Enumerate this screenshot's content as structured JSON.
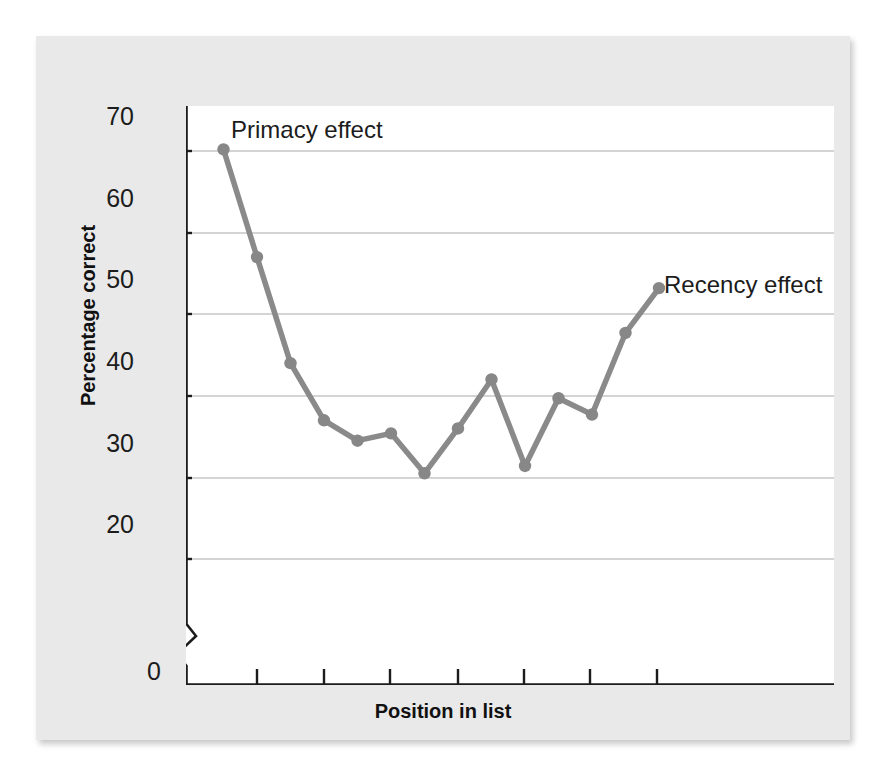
{
  "figure": {
    "background_color": "#e9e9e9",
    "plot_background_color": "#ffffff",
    "line_color": "#8a8a8a",
    "marker_color": "#878787",
    "axis_color": "#1c1c1c",
    "gridline_color": "#a9a9a9"
  },
  "chart_data": {
    "type": "line",
    "title": "",
    "xlabel": "Position in list",
    "ylabel": "Percentage correct",
    "x": [
      1,
      2,
      3,
      4,
      5,
      6,
      7,
      8,
      9,
      10,
      11,
      12,
      13,
      14
    ],
    "values": [
      70.2,
      57.0,
      44.0,
      37.0,
      34.5,
      35.4,
      30.5,
      36.0,
      42.0,
      31.4,
      39.7,
      37.7,
      47.7,
      53.2
    ],
    "series": [
      {
        "name": "Serial position curve",
        "values": [
          70.2,
          57.0,
          44.0,
          37.0,
          34.5,
          35.4,
          30.5,
          36.0,
          42.0,
          31.4,
          39.7,
          37.7,
          47.7,
          53.2
        ]
      }
    ],
    "xlim": [
      0,
      14.5
    ],
    "ylim": [
      15,
      75
    ],
    "xticks": [
      0,
      2,
      4,
      6,
      8,
      10,
      12,
      14
    ],
    "xtick_labels": [
      "0",
      "2",
      "4",
      "6",
      "8",
      "10",
      "12",
      "14"
    ],
    "yticks": [
      20,
      30,
      40,
      50,
      60,
      70
    ],
    "ytick_labels": [
      "20",
      "30",
      "40",
      "50",
      "60",
      "70"
    ],
    "grid": "horizontal",
    "legend": "none",
    "y_axis_break": true,
    "annotations": [
      {
        "text": "Primacy effect",
        "x": 1.35,
        "y": 73.0
      },
      {
        "text": "Recency effect",
        "x": 10.6,
        "y": 57.8
      }
    ]
  },
  "annotations": {
    "primacy": "Primacy effect",
    "recency": "Recency effect"
  },
  "axes": {
    "x_title": "Position in list",
    "y_title": "Percentage correct"
  },
  "ytick_labels": {
    "t20": "20",
    "t30": "30",
    "t40": "40",
    "t50": "50",
    "t60": "60",
    "t70": "70"
  },
  "xtick_labels": {
    "t0": "0",
    "t2": "2",
    "t4": "4",
    "t6": "6",
    "t8": "8",
    "t10": "10",
    "t12": "12",
    "t14": "14"
  }
}
